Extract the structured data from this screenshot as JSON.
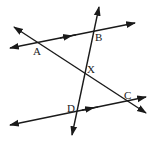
{
  "diagram": {
    "type": "geometry-parallel-lines-transversals",
    "points": {
      "A": {
        "label": "A",
        "x": 38,
        "y": 43
      },
      "B": {
        "label": "B",
        "x": 93,
        "y": 31
      },
      "X": {
        "label": "X",
        "x": 85,
        "y": 74
      },
      "C": {
        "label": "C",
        "x": 127,
        "y": 102
      },
      "D": {
        "label": "D",
        "x": 76,
        "y": 110
      }
    },
    "lines": [
      {
        "name": "top-parallel-line",
        "through": [
          "A",
          "B"
        ],
        "parallel_marker": true
      },
      {
        "name": "bottom-parallel-line",
        "through": [
          "D",
          "C"
        ],
        "parallel_marker": true
      },
      {
        "name": "transversal-AC",
        "through": [
          "A",
          "X",
          "C"
        ]
      },
      {
        "name": "transversal-BD",
        "through": [
          "B",
          "X",
          "D"
        ]
      }
    ],
    "stroke_color": "#1a1a1a",
    "background": "#ffffff"
  }
}
